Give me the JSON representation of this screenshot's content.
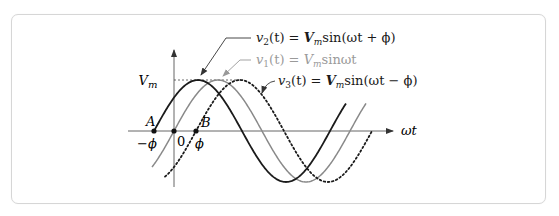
{
  "diagram": {
    "type": "phase-shifted sinusoids",
    "axes": {
      "x_label": "ωt",
      "origin_label": "0",
      "y_peak_label_main": "V",
      "y_peak_label_sub": "m"
    },
    "points": [
      {
        "name": "A",
        "value_label": "−ϕ",
        "x": 154
      },
      {
        "name": "origin",
        "value_label": "0",
        "x": 174
      },
      {
        "name": "B",
        "value_label": "ϕ",
        "x": 196
      }
    ],
    "point_labels": {
      "A": "A",
      "B": "B",
      "neg_phi": "−ϕ",
      "zero": "0",
      "phi": "ϕ"
    },
    "geometry": {
      "baseline_y": 131,
      "amplitude_px": 51,
      "period_px": 176,
      "y_axis_x": 174,
      "x_axis_start": 128,
      "x_axis_end": 393,
      "y_axis_top": 50,
      "y_axis_bottom": 187,
      "peak_dash_x_start": 174
    },
    "curves": [
      {
        "id": "v2",
        "zero_x": 154,
        "x_start": 154,
        "x_end": 346,
        "style": "solid-dark",
        "color": "#1a1a1a",
        "width": 1.8
      },
      {
        "id": "v1",
        "zero_x": 174,
        "x_start": 152,
        "x_end": 366,
        "style": "solid-gray",
        "color": "#8a8a8a",
        "width": 1.5
      },
      {
        "id": "v3",
        "zero_x": 196,
        "x_start": 165,
        "x_end": 372,
        "style": "dotted",
        "color": "#1a1a1a",
        "width": 1.8
      }
    ],
    "labels": {
      "v2": {
        "lhs_v": "v",
        "lhs_sub": "2",
        "lhs_rest": "(t) = ",
        "V": "V",
        "V_sub": "m",
        "rhs": "sin(ωt + ϕ)",
        "color": "#1a1a1a"
      },
      "v1": {
        "lhs_v": "v",
        "lhs_sub": "1",
        "lhs_rest": "(t) = ",
        "V": "V",
        "V_sub": "m",
        "rhs": "sinωt",
        "color": "#9a9a9a"
      },
      "v3": {
        "lhs_v": "v",
        "lhs_sub": "3",
        "lhs_rest": "(t) = ",
        "V": "V",
        "V_sub": "m",
        "rhs": "sin(ωt − ϕ)",
        "color": "#1a1a1a"
      }
    },
    "colors": {
      "frame_border": "#d6d6d6",
      "axis": "#555555",
      "dark": "#1a1a1a",
      "gray": "#8a8a8a"
    }
  }
}
